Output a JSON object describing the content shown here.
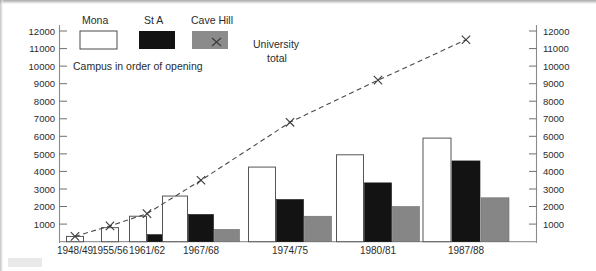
{
  "figure": {
    "kind": "grouped-bar-with-line-overlay"
  },
  "legend": {
    "entries": [
      {
        "label": "Mona",
        "swatch": "white-swatch",
        "color": "#ffffff"
      },
      {
        "label": "St A",
        "swatch": "black-swatch",
        "color": "#131313"
      },
      {
        "label": "Cave Hill",
        "swatch": "gray-swatch",
        "color": "#868686"
      }
    ],
    "note": "Campus in order of opening",
    "series_annotation_line1": "University",
    "series_annotation_line2": "total",
    "series_annotation_marker": "x-marker-icon"
  },
  "axes": {
    "left_tick_labels": [
      "12000",
      "11000",
      "10000",
      "9000",
      "8000",
      "7000",
      "6000",
      "5000",
      "4000",
      "3000",
      "2000",
      "1000"
    ],
    "right_tick_labels": [
      "12000",
      "11000",
      "10000",
      "9000",
      "8000",
      "7000",
      "6000",
      "5000",
      "4000",
      "3000",
      "2000",
      "1000"
    ],
    "category_labels": [
      "1948/49",
      "1955/56",
      "1961/62",
      "1967/68",
      "1974/75",
      "1980/81",
      "1987/88"
    ]
  },
  "chart_data": {
    "type": "bar",
    "title": "",
    "subtitle": "",
    "xlabel": "",
    "ylabel": "",
    "ylim": [
      0,
      12500
    ],
    "ytick_interval": 1000,
    "grid": false,
    "legend_position": "top-left",
    "dual_axis": true,
    "categories": [
      "1948/49",
      "1955/56",
      "1961/62",
      "1967/68",
      "1974/75",
      "1980/81",
      "1987/88"
    ],
    "series": [
      {
        "name": "Mona",
        "type": "bar",
        "color": "#ffffff",
        "values": [
          300,
          800,
          1450,
          2600,
          4250,
          4950,
          5900
        ]
      },
      {
        "name": "St A",
        "type": "bar",
        "color": "#131313",
        "values": [
          0,
          0,
          400,
          1550,
          2400,
          3350,
          4600
        ]
      },
      {
        "name": "Cave Hill",
        "type": "bar",
        "color": "#868686",
        "values": [
          0,
          0,
          0,
          700,
          1450,
          2000,
          2500
        ]
      },
      {
        "name": "University total",
        "type": "line",
        "color": "#4a4a4a",
        "style": "dashed",
        "marker": "x",
        "values": [
          300,
          900,
          1600,
          3500,
          6800,
          9200,
          11500
        ]
      }
    ],
    "annotations": [
      {
        "text": "Campus in order of opening"
      },
      {
        "text": "University total"
      }
    ]
  }
}
